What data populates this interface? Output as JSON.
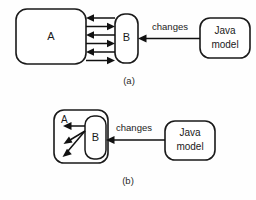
{
  "figure": {
    "type": "diagram",
    "background_color": "#fefefe",
    "stroke_color": "#111111",
    "fill_color": "#ffffff",
    "panels": [
      {
        "id": "panel-a",
        "caption": "(a)",
        "nodes": [
          {
            "id": "a-node-a",
            "label": "A",
            "shape": "rounded-rect"
          },
          {
            "id": "a-node-b",
            "label": "B",
            "shape": "rounded-rect"
          },
          {
            "id": "a-node-java",
            "label_line1": "Java",
            "label_line2": "model",
            "shape": "rounded-rect"
          }
        ],
        "edges": [
          {
            "id": "a-edge-1",
            "from": "B",
            "to": "A",
            "direction": "left"
          },
          {
            "id": "a-edge-2",
            "from": "A",
            "to": "B",
            "direction": "right"
          },
          {
            "id": "a-edge-3",
            "from": "B",
            "to": "A",
            "direction": "left"
          },
          {
            "id": "a-edge-4",
            "from": "A",
            "to": "B",
            "direction": "right"
          },
          {
            "id": "a-edge-5",
            "from": "B",
            "to": "A",
            "direction": "left"
          },
          {
            "id": "a-edge-6",
            "from": "A",
            "to": "B",
            "direction": "right"
          },
          {
            "id": "a-edge-changes",
            "from": "Java model",
            "to": "B",
            "label": "changes",
            "direction": "left"
          }
        ]
      },
      {
        "id": "panel-b",
        "caption": "(b)",
        "nodes": [
          {
            "id": "b-node-a",
            "label": "A",
            "shape": "rounded-rect",
            "contains": "B"
          },
          {
            "id": "b-node-b",
            "label": "B",
            "shape": "rounded-rect"
          },
          {
            "id": "b-node-java",
            "label_line1": "Java",
            "label_line2": "model",
            "shape": "rounded-rect"
          }
        ],
        "edges": [
          {
            "id": "b-edge-1",
            "from": "B",
            "to": "A",
            "direction": "left"
          },
          {
            "id": "b-edge-2",
            "from": "B",
            "to": "A",
            "direction": "down-left"
          },
          {
            "id": "b-edge-3",
            "from": "B",
            "to": "A",
            "direction": "down-left-steep"
          },
          {
            "id": "b-edge-changes",
            "from": "Java model",
            "to": "B",
            "label": "changes",
            "direction": "left"
          }
        ]
      }
    ]
  }
}
